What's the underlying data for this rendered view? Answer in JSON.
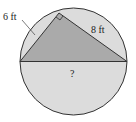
{
  "diagram": {
    "type": "circle-inscribed-right-triangle",
    "labels": {
      "leg_short": "6 ft",
      "leg_long": "8 ft",
      "hypotenuse": "?"
    },
    "colors": {
      "circle_fill": "#dcdcdc",
      "triangle_fill": "#aaaaaa",
      "stroke": "#333333"
    }
  }
}
